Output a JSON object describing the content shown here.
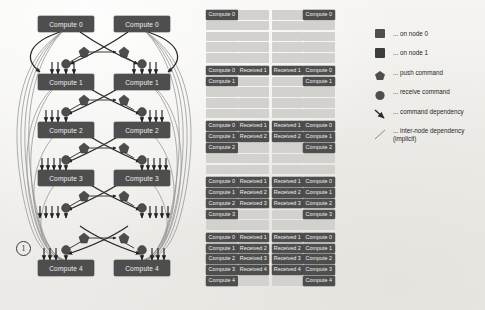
{
  "figure": {
    "background_color": "#f2f1ee",
    "node_fill": "#4e4e4e",
    "empty_cell_color": "#d2d1cd",
    "text_on_node": "#f0efec"
  },
  "graph": {
    "annotation_marker": "1",
    "levels": [
      {
        "left_label": "Compute 0",
        "right_label": "Compute 0"
      },
      {
        "left_label": "Compute 1",
        "right_label": "Compute 1"
      },
      {
        "left_label": "Compute 2",
        "right_label": "Compute 2"
      },
      {
        "left_label": "Compute 3",
        "right_label": "Compute 3"
      },
      {
        "left_label": "Compute 4",
        "right_label": "Compute 4"
      }
    ],
    "node_shapes": {
      "push": "pentagon",
      "receive": "circle",
      "compute": "rectangle"
    }
  },
  "schedule": {
    "blocks": [
      {
        "rows": [
          [
            "Compute 0",
            "",
            "",
            "Compute 0"
          ],
          [
            "",
            "",
            "",
            ""
          ],
          [
            "",
            "",
            "",
            ""
          ],
          [
            "",
            "",
            "",
            ""
          ],
          [
            "",
            "",
            "",
            ""
          ]
        ]
      },
      {
        "rows": [
          [
            "Compute 0",
            "Received 1",
            "Received 1",
            "Compute 0"
          ],
          [
            "Compute 1",
            "",
            "",
            "Compute 1"
          ],
          [
            "",
            "",
            "",
            ""
          ],
          [
            "",
            "",
            "",
            ""
          ],
          [
            "",
            "",
            "",
            ""
          ]
        ]
      },
      {
        "rows": [
          [
            "Compute 0",
            "Received 1",
            "Received 1",
            "Compute 0"
          ],
          [
            "Compute 1",
            "Received 2",
            "Received 2",
            "Compute 1"
          ],
          [
            "Compute 2",
            "",
            "",
            "Compute 2"
          ],
          [
            "",
            "",
            "",
            ""
          ],
          [
            "",
            "",
            "",
            ""
          ]
        ]
      },
      {
        "rows": [
          [
            "Compute 0",
            "Received 1",
            "Received 1",
            "Compute 0"
          ],
          [
            "Compute 1",
            "Received 2",
            "Received 2",
            "Compute 1"
          ],
          [
            "Compute 2",
            "Received 3",
            "Received 3",
            "Compute 2"
          ],
          [
            "Compute 3",
            "",
            "",
            "Compute 3"
          ],
          [
            "",
            "",
            "",
            ""
          ]
        ]
      },
      {
        "rows": [
          [
            "Compute 0",
            "Received 1",
            "Received 1",
            "Compute 0"
          ],
          [
            "Compute 1",
            "Received 2",
            "Received 2",
            "Compute 1"
          ],
          [
            "Compute 2",
            "Received 3",
            "Received 3",
            "Compute 2"
          ],
          [
            "Compute 3",
            "Received 4",
            "Received 4",
            "Compute 3"
          ],
          [
            "Compute 4",
            "",
            "",
            "Compute 4"
          ]
        ]
      }
    ]
  },
  "legend": {
    "items": [
      {
        "marker": "square",
        "color": "#4e4e4e",
        "label": "... on node 0"
      },
      {
        "marker": "square",
        "color": "#3c3c3c",
        "label": "... on node 1"
      },
      {
        "marker": "pentagon",
        "color": "#4e4e4e",
        "label": "... push command"
      },
      {
        "marker": "circle",
        "color": "#4e4e4e",
        "label": "... receive command"
      },
      {
        "marker": "arrow",
        "color": "#2b2b2b",
        "label": "... command dependency"
      },
      {
        "marker": "line",
        "color": "#8a8a8a",
        "label": "... inter-node dependency",
        "sub": "(implicit)"
      }
    ]
  }
}
